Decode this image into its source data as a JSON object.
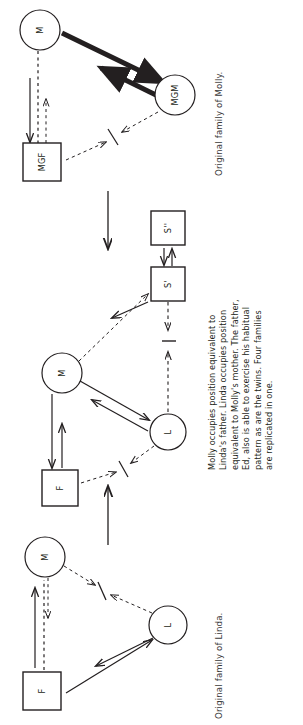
{
  "figure": {
    "orientation": "rotated-90-ccw",
    "type": "family-systems-diagram",
    "stroke_color": "#231f20",
    "text_color": "#3a3a3a"
  },
  "captions": {
    "top": "Original family of Molly.",
    "bottom": "Original family of Linda.",
    "middle_lines": [
      "Molly occupies position equivalent to",
      "Linda's father.  Linda occupies position",
      "equivalent to Molly's mother.  The father,",
      "Ed, also is able to exercise his habitual",
      "pattern as are the twins. Four families",
      "are replicated in one."
    ]
  },
  "families": [
    {
      "name": "molly-family",
      "caption": "Original family of Molly.",
      "nodes": [
        {
          "id": "molly-M",
          "label": "M",
          "shape": "circle",
          "cx": 40,
          "cy": 30,
          "r": 20
        },
        {
          "id": "molly-MGM",
          "label": "MGM",
          "shape": "circle",
          "cx": 175,
          "cy": 95,
          "r": 20
        },
        {
          "id": "molly-MGF",
          "label": "MGF",
          "shape": "square",
          "cx": 42,
          "cy": 162,
          "size": 38
        }
      ],
      "conflict_marker": {
        "x": 113,
        "y": 137
      }
    },
    {
      "name": "combined-family",
      "nodes": [
        {
          "id": "mid-M",
          "label": "M",
          "shape": "circle",
          "cx": 62,
          "cy": 373,
          "r": 20
        },
        {
          "id": "mid-L",
          "label": "L",
          "shape": "circle",
          "cx": 168,
          "cy": 432,
          "r": 18
        },
        {
          "id": "mid-F",
          "label": "F",
          "shape": "square",
          "cx": 60,
          "cy": 488,
          "size": 36
        },
        {
          "id": "mid-S1",
          "label": "S'",
          "shape": "square",
          "cx": 168,
          "cy": 284,
          "size": 34
        },
        {
          "id": "mid-S2",
          "label": "S''",
          "shape": "square",
          "cx": 168,
          "cy": 228,
          "size": 34
        }
      ],
      "conflict_markers": [
        {
          "x": 123,
          "y": 470
        },
        {
          "x": 168,
          "y": 341
        }
      ]
    },
    {
      "name": "linda-family",
      "caption": "Original family of Linda.",
      "nodes": [
        {
          "id": "lin-M",
          "label": "M",
          "shape": "circle",
          "cx": 45,
          "cy": 557,
          "r": 20
        },
        {
          "id": "lin-L",
          "label": "L",
          "shape": "circle",
          "cx": 168,
          "cy": 625,
          "r": 19
        },
        {
          "id": "lin-F",
          "label": "F",
          "shape": "square",
          "cx": 42,
          "cy": 691,
          "size": 38
        }
      ],
      "conflict_marker": {
        "x": 100,
        "y": 592
      }
    }
  ],
  "connectors": [
    {
      "id": "molly-to-combined",
      "direction": "down",
      "x": 108,
      "y1": 190,
      "y2": 250
    },
    {
      "id": "linda-to-combined",
      "direction": "up",
      "x": 108,
      "y1": 545,
      "y2": 485
    }
  ]
}
